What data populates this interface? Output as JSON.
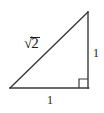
{
  "figure": {
    "name": "right-triangle-45-45-90",
    "background_color": "#ffffff",
    "stroke_color": "#3a3a3a",
    "text_color": "#1b1b1b"
  },
  "labels": {
    "hypotenuse": {
      "radical_sign": "√",
      "radicand": "2",
      "full_text": "√2"
    },
    "vertical_leg": "1",
    "horizontal_leg": "1"
  },
  "geometry": {
    "vertices": {
      "left": [
        10,
        88
      ],
      "top_right": [
        88,
        12
      ],
      "bottom_right": [
        88,
        88
      ]
    },
    "right_angle_marker": {
      "corner": [
        88,
        88
      ],
      "size": 9
    }
  }
}
